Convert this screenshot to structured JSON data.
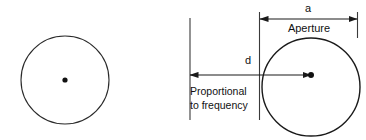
{
  "figure": {
    "background_color": "#ffffff",
    "stroke_color": "#1a1a1a",
    "text_color": "#111111",
    "left_diagram": {
      "name": "plain-circle",
      "center_dot_label": "",
      "circle": {
        "cx": 65,
        "cy": 80,
        "r": 44
      },
      "center_dot_radius": 2.6
    },
    "right_diagram": {
      "name": "aperture-circle",
      "circle": {
        "cx": 311,
        "cy": 87,
        "r": 49
      },
      "center_dot_radius": 3.0,
      "labels": {
        "aperture_dimension": "a",
        "aperture_name": "Aperture",
        "distance_dimension": "d",
        "distance_note_line1": "Proportional",
        "distance_note_line2": "to frequency"
      },
      "dimension_a": {
        "x_start": 259,
        "x_end": 357,
        "y": 19
      },
      "dimension_d": {
        "x_start": 189,
        "x_end": 311,
        "y": 75
      },
      "reference_line_left": {
        "x": 190,
        "y_top": 18,
        "y_bottom": 120
      },
      "reference_line_circle_edge": {
        "x": 262,
        "y_top": 24,
        "y_bottom": 120
      }
    }
  }
}
